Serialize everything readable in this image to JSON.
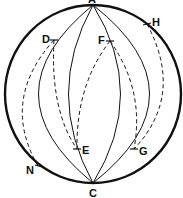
{
  "diagram": {
    "type": "sphere-meridians",
    "poles": {
      "top": "A",
      "bottom": "C"
    },
    "labels": {
      "A": "A",
      "C": "C",
      "D": "D",
      "E": "E",
      "F": "F",
      "G": "G",
      "H": "H",
      "N": "N"
    },
    "meridians_solid_count": 4,
    "dashed_paths": [
      {
        "from": "D",
        "to": "N"
      },
      {
        "from": "D",
        "to": "E"
      },
      {
        "from": "F",
        "to": "E"
      },
      {
        "from": "F",
        "to": "G"
      },
      {
        "from": "H",
        "to": "G"
      }
    ],
    "colors": {
      "stroke": "#111111",
      "background": "#ffffff"
    }
  }
}
